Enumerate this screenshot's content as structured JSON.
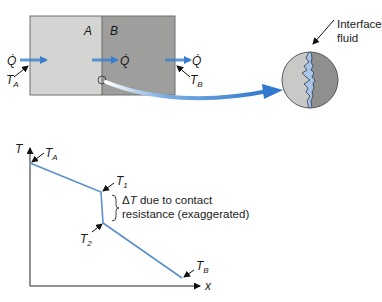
{
  "figure": {
    "block": {
      "label_a": "A",
      "label_b": "B",
      "color_a": "#d4d4d2",
      "color_b": "#9e9e9c",
      "heat_flow_symbol": "Q̇",
      "left_temp": {
        "main": "T",
        "sub": "A"
      },
      "right_temp": {
        "main": "T",
        "sub": "B"
      }
    },
    "magnified_view": {
      "label_line1": "Interface",
      "label_line2": "fluid",
      "fluid_color": "#a8c4e6"
    },
    "arrow_color": "#3a7fcf",
    "graph": {
      "y_axis_label": "T",
      "x_axis_label": "x",
      "line_color": "#5a8fcf",
      "points": {
        "TA": {
          "main": "T",
          "sub": "A"
        },
        "T1": {
          "main": "T",
          "sub": "1"
        },
        "T2": {
          "main": "T",
          "sub": "2"
        },
        "TB": {
          "main": "T",
          "sub": "B"
        }
      },
      "annotation_line1_delta": "Δ",
      "annotation_line1_T": "T",
      "annotation_line1_rest": " due to contact",
      "annotation_line2": "resistance (exaggerated)"
    }
  }
}
